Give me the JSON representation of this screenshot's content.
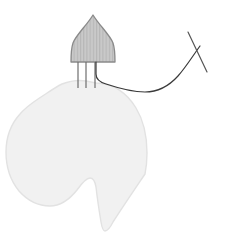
{
  "figure": {
    "title": "Line-art illustration of a dome-shaped striped device with three prongs attached to a pale organic body shape, with a suture thread crossing a straight needle",
    "caption": "",
    "background_color": "#ffffff",
    "canvas": {
      "width": 226,
      "height": 232
    }
  },
  "palette": {
    "background": "#ffffff",
    "body_fill": "#f1f1f1",
    "body_stroke": "#e2e2e2",
    "device_fill": "#c9c9c9",
    "device_stroke": "#8a8a8a",
    "device_stripe": "#b6b6b6",
    "prong_stroke": "#6e6e6e",
    "thread_stroke": "#3a3a3a",
    "needle_stroke": "#555555"
  },
  "elements": {
    "body_blob": {
      "name": "organic body shape",
      "fill": "#f1f1f1",
      "stroke": "#e2e2e2",
      "stroke_width": "1.4",
      "path": "M 96 83 C 113 83 127 93 136 108 C 144 121 147 138 147 153 C 147 162 146 169 145 174 C 141 180 124 205 113 222 C 110 228 107 231 105 231 C 103 231 102 228 101 222 C 99 210 97 196 96 187 C 95 181 93 178 90 178 C 86 178 82 183 77 190 C 69 200 60 206 50 206 C 38 206 27 200 19 191 C 10 180 6 166 6 152 C 6 137 11 124 20 114 C 26 107 32 103 38 99 C 46 94 54 88 62 84 C 70 81 80 80 86 81 Z"
    },
    "device_dome": {
      "name": "dome shaped striped device head",
      "fill": "#c9c9c9",
      "stroke": "#8a8a8a",
      "stroke_width": "1.3",
      "path": "M 93 15 C 99 25 110 35 113 43 C 115 49 115 55 115 62 L 71 62 C 71 55 71 49 73 43 C 76 35 87 25 93 15 Z",
      "stripe_color": "#b6b6b6",
      "stripe_count": 14,
      "stripe_spacing": 3.2
    },
    "prongs": {
      "name": "three vertical prong legs",
      "stroke": "#6e6e6e",
      "stroke_width": "1.2",
      "top_y": 62,
      "bottom_y": 88,
      "x_positions": [
        78,
        86,
        95
      ]
    },
    "thread": {
      "name": "suture thread curve",
      "stroke": "#3a3a3a",
      "stroke_width": "1.2",
      "path": "M 96 62 L 96 74 C 96 79 99 82 106 84 C 118 88 132 92 145 92 C 158 92 169 86 178 76 C 186 67 192 57 200 46"
    },
    "needle": {
      "name": "straight needle",
      "stroke": "#555555",
      "stroke_width": "1.2",
      "path": "M 188 32 L 207 72"
    }
  }
}
